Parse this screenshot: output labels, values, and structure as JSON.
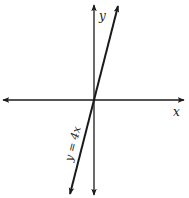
{
  "diagram": {
    "type": "coordinate-plane-line-graph",
    "axes": {
      "x_label": "x",
      "y_label": "y"
    },
    "line": {
      "equation_label": "y = 4x",
      "slope": 4,
      "intercept": 0
    },
    "colors": {
      "stroke": "#1a1a1a",
      "background": "#ffffff"
    }
  }
}
